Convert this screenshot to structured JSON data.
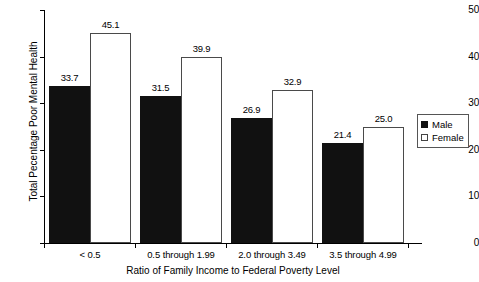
{
  "chart_data": {
    "type": "bar",
    "title": "",
    "xlabel": "Ratio of Family Income to Federal Poverty Level",
    "ylabel": "Total Pecentage Poor Mental Health",
    "categories": [
      "< 0.5",
      "0.5 through 1.99",
      "2.0 through 3.49",
      "3.5 through 4.99"
    ],
    "series": [
      {
        "name": "Male",
        "values": [
          33.7,
          31.5,
          26.9,
          21.4
        ],
        "color": "#111111",
        "fill": "solid"
      },
      {
        "name": "Female",
        "values": [
          45.1,
          39.9,
          32.9,
          25.0
        ],
        "color": "#ffffff",
        "fill": "open"
      }
    ],
    "ylim": [
      0,
      50
    ],
    "yticks": [
      0,
      10,
      20,
      30,
      40,
      50
    ],
    "ytick_labels": [
      "0",
      "10",
      "20",
      "30",
      "40",
      "50"
    ],
    "grid": false,
    "legend_position": "right",
    "value_labels": [
      "33.7",
      "45.1",
      "31.5",
      "39.9",
      "26.9",
      "32.9",
      "21.4",
      "25.0"
    ]
  },
  "legend": {
    "entries": [
      {
        "label": "Male"
      },
      {
        "label": "Female"
      }
    ]
  }
}
